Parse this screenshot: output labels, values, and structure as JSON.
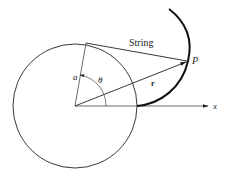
{
  "diagram": {
    "labels": {
      "string": "String",
      "point": "P",
      "radius": "a",
      "angle": "θ",
      "position_vector": "r",
      "x_axis": "x"
    },
    "geometry": {
      "circle_center": [
        75,
        106
      ],
      "circle_radius": 62,
      "tangent_point": [
        86,
        43
      ],
      "point_P": [
        188,
        61
      ],
      "x_axis_end": [
        209,
        106
      ]
    },
    "colors": {
      "stroke": "#222222",
      "background": "#ffffff"
    }
  }
}
